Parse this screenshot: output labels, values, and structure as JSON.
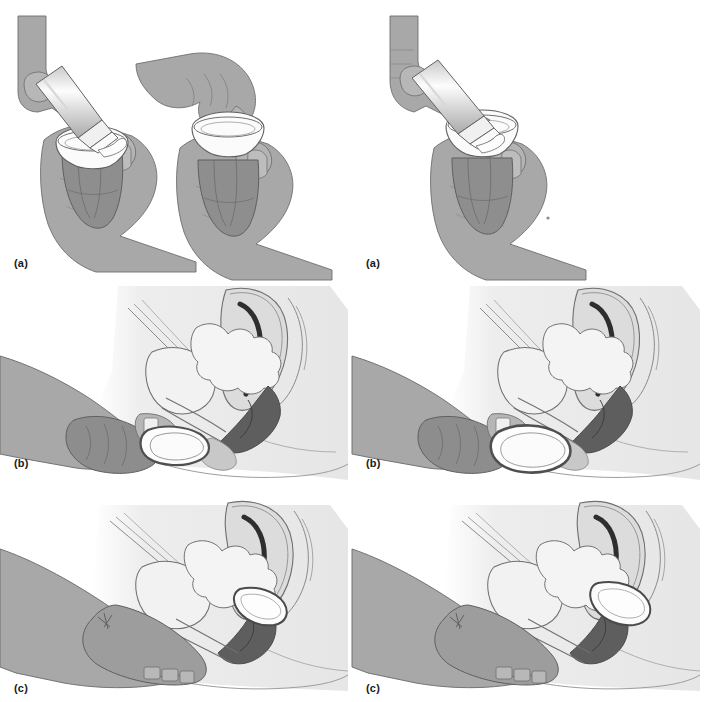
{
  "figure": {
    "columns": 2,
    "rows": 3,
    "background_color": "#ffffff",
    "style": "grayscale medical line illustration"
  },
  "palette": {
    "skin_mid": "#a8a8a8",
    "skin_light": "#c2c2c2",
    "skin_shadow": "#8f8f8f",
    "skin_dark": "#7d7d7d",
    "body_pale": "#e9e9e9",
    "body_pale2": "#dedede",
    "organ_fill": "#f2f2f2",
    "uterus_fill": "#dcdcdc",
    "rectum_dark": "#4a4a4a",
    "cavity_black": "#2e2e2e",
    "device_white": "#fbfbfb",
    "outline": "#5a5a5a",
    "outline_soft": "#8a8a8a",
    "label_color": "#1a1a1a"
  },
  "panels": [
    {
      "id": "left-a",
      "label": "(a)",
      "column": "left",
      "row": 1,
      "caption_position": "bottom-left",
      "scene": "applying-spermicide",
      "description": "Two hands shown twice: left hand squeezing a spermicide tube into the dome of a diaphragm held in the other hand, and a hand spreading the gel around the rim.",
      "elements": [
        "spermicide-tube",
        "diaphragm-dome",
        "holding-hand",
        "squeezing-hand"
      ]
    },
    {
      "id": "right-a",
      "label": "(a)",
      "column": "right",
      "row": 1,
      "caption_position": "bottom-left",
      "scene": "applying-spermicide",
      "description": "Single hand squeezing a spermicide tube into the dome of a cervical cap held in the opposite hand.",
      "elements": [
        "spermicide-tube",
        "cervical-cap-dome",
        "holding-hand",
        "squeezing-hand"
      ]
    },
    {
      "id": "left-b",
      "label": "(b)",
      "column": "left",
      "row": 2,
      "caption_position": "left",
      "scene": "inserting-folded-device",
      "description": "Sagittal cross-section of the female pelvis with the folded diaphragm pinched between fingers at the vaginal introitus, ready for insertion.",
      "elements": [
        "uterus",
        "uterine-cavity",
        "bladder",
        "rectum",
        "vagina",
        "pubic-bone",
        "folded-diaphragm",
        "inserting-hand"
      ]
    },
    {
      "id": "right-b",
      "label": "(b)",
      "column": "right",
      "row": 2,
      "caption_position": "left",
      "scene": "inserting-folded-device",
      "description": "Sagittal cross-section of the female pelvis with the folded cervical cap pinched between fingers at the vaginal introitus.",
      "elements": [
        "uterus",
        "uterine-cavity",
        "bladder",
        "rectum",
        "vagina",
        "pubic-bone",
        "folded-cap",
        "inserting-hand"
      ]
    },
    {
      "id": "left-c",
      "label": "(c)",
      "column": "left",
      "row": 3,
      "caption_position": "bottom-left",
      "scene": "device-seated-over-cervix",
      "description": "Sagittal cross-section showing the diaphragm seated in the posterior fornix covering the cervix, with fingers checking placement.",
      "elements": [
        "uterus",
        "uterine-cavity",
        "bladder",
        "rectum",
        "vagina",
        "seated-diaphragm",
        "checking-hand"
      ]
    },
    {
      "id": "right-c",
      "label": "(c)",
      "column": "right",
      "row": 3,
      "caption_position": "bottom-left",
      "scene": "device-seated-over-cervix",
      "description": "Sagittal cross-section showing the cervical cap seated over the cervix, with fingers confirming coverage.",
      "elements": [
        "uterus",
        "uterine-cavity",
        "bladder",
        "rectum",
        "vagina",
        "seated-cap",
        "checking-hand"
      ]
    }
  ],
  "labels": {
    "left_a": "(a)",
    "left_b": "(b)",
    "left_c": "(c)",
    "right_a": "(a)",
    "right_b": "(b)",
    "right_c": "(c)"
  }
}
